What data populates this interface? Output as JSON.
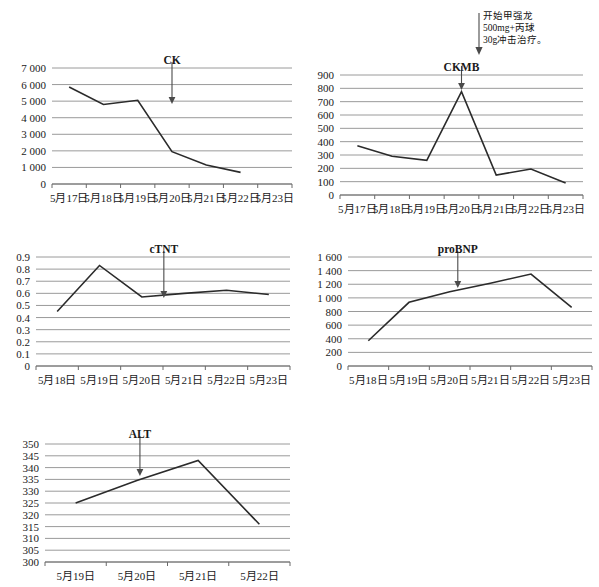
{
  "document": {
    "kind": "lab-result-trend-figure",
    "panel_count": 5,
    "colors": {
      "gridline": "#9a9a9a",
      "axis": "#3a3a3a",
      "series": "#2b2b2b",
      "arrow": "#4a4a4a",
      "background": "#ffffff"
    }
  },
  "annotation": {
    "name": "treatment-start-note",
    "lines": [
      "开始甲强龙",
      "500mg+丙球",
      "30g冲击治疗。"
    ],
    "arrow": "down-arrow"
  },
  "chart_data": [
    {
      "id": "ck",
      "type": "line",
      "title": "CK",
      "xlabel": "",
      "ylabel": "",
      "grid": true,
      "legend": "none",
      "categories": [
        "5月17日",
        "5月18日",
        "5月19日",
        "5月20日",
        "5月21日",
        "5月22日",
        "5月23日"
      ],
      "x": [
        "5月17日",
        "5月18日",
        "5月19日",
        "5月20日",
        "5月21日",
        "5月22日",
        "5月23日"
      ],
      "values": [
        5850,
        4800,
        5050,
        1950,
        1150,
        700,
        null
      ],
      "point_count": 6,
      "ytick_labels": [
        "0",
        "1 000",
        "2 000",
        "3 000",
        "4 000",
        "5 000",
        "6 000",
        "7 000"
      ],
      "yticks": [
        0,
        1000,
        2000,
        3000,
        4000,
        5000,
        6000,
        7000
      ],
      "ylim": [
        0,
        7000
      ],
      "annotation_marker": {
        "label": "CK",
        "at": "5月20日"
      }
    },
    {
      "id": "ckmb",
      "type": "line",
      "title": "CKMB",
      "xlabel": "",
      "ylabel": "",
      "grid": true,
      "legend": "none",
      "categories": [
        "5月17日",
        "5月18日",
        "5月19日",
        "5月20日",
        "5月21日",
        "5月22日",
        "5月23日"
      ],
      "x": [
        "5月17日",
        "5月18日",
        "5月19日",
        "5月20日",
        "5月21日",
        "5月22日",
        "5月23日"
      ],
      "values": [
        370,
        290,
        260,
        775,
        150,
        195,
        90
      ],
      "point_count": 7,
      "ytick_labels": [
        "0",
        "100",
        "200",
        "300",
        "400",
        "500",
        "600",
        "700",
        "800",
        "900"
      ],
      "yticks": [
        0,
        100,
        200,
        300,
        400,
        500,
        600,
        700,
        800,
        900
      ],
      "ylim": [
        0,
        900
      ],
      "annotation_marker": {
        "label": "CKMB",
        "at": "5月20日"
      }
    },
    {
      "id": "ctnt",
      "type": "line",
      "title": "cTNT",
      "xlabel": "",
      "ylabel": "",
      "grid": true,
      "legend": "none",
      "categories": [
        "5月18日",
        "5月19日",
        "5月20日",
        "5月21日",
        "5月22日",
        "5月23日"
      ],
      "x": [
        "5月18日",
        "5月19日",
        "5月20日",
        "5月21日",
        "5月22日",
        "5月23日"
      ],
      "values": [
        0.45,
        0.83,
        0.57,
        0.6,
        0.625,
        0.59
      ],
      "point_count": 6,
      "ytick_labels": [
        "0",
        "0.1",
        "0.2",
        "0.3",
        "0.4",
        "0.5",
        "0.6",
        "0.7",
        "0.8",
        "0.9"
      ],
      "yticks": [
        0,
        0.1,
        0.2,
        0.3,
        0.4,
        0.5,
        0.6,
        0.7,
        0.8,
        0.9
      ],
      "ylim": [
        0,
        0.9
      ],
      "annotation_marker": {
        "label": "cTNT",
        "at": "5月20日"
      }
    },
    {
      "id": "probnp",
      "type": "line",
      "title": "proBNP",
      "xlabel": "",
      "ylabel": "",
      "grid": true,
      "legend": "none",
      "categories": [
        "5月18日",
        "5月19日",
        "5月20日",
        "5月21日",
        "5月22日",
        "5月23日"
      ],
      "x": [
        "5月18日",
        "5月19日",
        "5月20日",
        "5月21日",
        "5月22日",
        "5月23日"
      ],
      "values": [
        370,
        935,
        1090,
        1215,
        1350,
        860
      ],
      "point_count": 6,
      "ytick_labels": [
        "0",
        "200",
        "400",
        "600",
        "800",
        "1 000",
        "1 200",
        "1 400",
        "1 600"
      ],
      "yticks": [
        0,
        200,
        400,
        600,
        800,
        1000,
        1200,
        1400,
        1600
      ],
      "ylim": [
        0,
        1600
      ],
      "annotation_marker": {
        "label": "proBNP",
        "at": "5月20日"
      }
    },
    {
      "id": "alt",
      "type": "line",
      "title": "ALT",
      "xlabel": "",
      "ylabel": "",
      "grid": true,
      "legend": "none",
      "categories": [
        "5月19日",
        "5月20日",
        "5月21日",
        "5月22日"
      ],
      "x": [
        "5月19日",
        "5月20日",
        "5月21日",
        "5月22日"
      ],
      "values": [
        325,
        334.5,
        343,
        316
      ],
      "point_count": 4,
      "ytick_labels": [
        "300",
        "305",
        "310",
        "315",
        "320",
        "325",
        "330",
        "335",
        "340",
        "345",
        "350"
      ],
      "yticks": [
        300,
        305,
        310,
        315,
        320,
        325,
        330,
        335,
        340,
        345,
        350
      ],
      "ylim": [
        300,
        350
      ],
      "annotation_marker": {
        "label": "ALT",
        "at": "5月20日"
      }
    }
  ]
}
